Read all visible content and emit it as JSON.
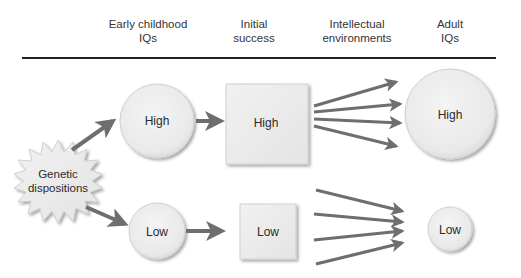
{
  "headers": [
    {
      "line1": "Early childhood",
      "line2": "IQs"
    },
    {
      "line1": "Initial",
      "line2": "success"
    },
    {
      "line1": "Intellectual",
      "line2": "environments"
    },
    {
      "line1": "Adult",
      "line2": "IQs"
    }
  ],
  "source": {
    "line1": "Genetic",
    "line2": "dispositions"
  },
  "high_path": {
    "childhood": "High",
    "success": "High",
    "adult": "High"
  },
  "low_path": {
    "childhood": "Low",
    "success": "Low",
    "adult": "Low"
  },
  "colors": {
    "arrow": "#6e6e6e",
    "node_fill": "#ececec",
    "node_stroke": "#c9c9c9",
    "rule": "#222222"
  }
}
